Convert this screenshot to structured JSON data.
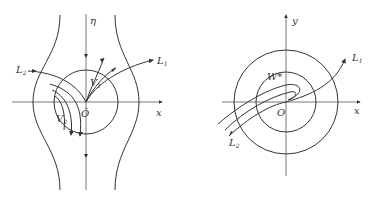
{
  "figures": [
    {
      "id": "left",
      "axes": {
        "horizontal": "x",
        "vertical": "η"
      },
      "origin_label": "Õ",
      "labels": {
        "L2": {
          "main": "L",
          "sub": "2",
          "hat": "~"
        },
        "L1": {
          "main": "L",
          "sub": "1",
          "hat": "~"
        },
        "V1": {
          "main": "V",
          "sub": "1",
          "hat": "~"
        },
        "V2": {
          "main": "V",
          "sub": "2",
          "hat": "~"
        }
      }
    },
    {
      "id": "right",
      "axes": {
        "horizontal": "x",
        "vertical": "y"
      },
      "origin_label": "O",
      "labels": {
        "W": {
          "main": "W*"
        },
        "L1": {
          "main": "L",
          "sub": "1",
          "sup": "+"
        },
        "L2": {
          "main": "L",
          "sub": "2",
          "sup": "+"
        }
      }
    }
  ],
  "colors": {
    "stroke": "#333333",
    "background": "#ffffff"
  }
}
